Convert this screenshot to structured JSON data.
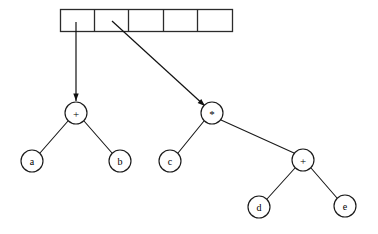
{
  "figure": {
    "background_color": "#ffffff",
    "stroke_color": "#1a1a1a",
    "node_fill": "#ffffff",
    "width": 378,
    "height": 234
  },
  "array": {
    "name": "pointer-array",
    "cell_count": 5,
    "x": 60,
    "y": 9,
    "width": 172,
    "height": 22,
    "cells": [
      {
        "index": 0,
        "label": "",
        "has_pointer": true
      },
      {
        "index": 1,
        "label": "",
        "has_pointer": true
      },
      {
        "index": 2,
        "label": "",
        "has_pointer": false
      },
      {
        "index": 3,
        "label": "",
        "has_pointer": false
      },
      {
        "index": 4,
        "label": "",
        "has_pointer": false
      }
    ],
    "dividers_x": [
      94,
      128,
      163,
      197
    ]
  },
  "pointers": [
    {
      "id": "pointer-0",
      "from_cell": 0,
      "to_node": "node-plus-1",
      "x1": 76,
      "y1": 22,
      "x2": 76,
      "y2": 101,
      "arrow": true
    },
    {
      "id": "pointer-1",
      "from_cell": 1,
      "to_node": "node-times",
      "x1": 112,
      "y1": 21,
      "x2": 205,
      "y2": 106,
      "arrow": true
    }
  ],
  "nodes": [
    {
      "id": "node-plus-1",
      "label": "+",
      "cx": 76,
      "cy": 113,
      "r": 11,
      "kind": "operator"
    },
    {
      "id": "node-a",
      "label": "a",
      "cx": 32,
      "cy": 161,
      "r": 11,
      "kind": "operand"
    },
    {
      "id": "node-b",
      "label": "b",
      "cx": 120,
      "cy": 161,
      "r": 11,
      "kind": "operand"
    },
    {
      "id": "node-times",
      "label": "*",
      "cx": 212,
      "cy": 113,
      "r": 11,
      "kind": "operator"
    },
    {
      "id": "node-c",
      "label": "c",
      "cx": 170,
      "cy": 161,
      "r": 11,
      "kind": "operand"
    },
    {
      "id": "node-plus-2",
      "label": "+",
      "cx": 303,
      "cy": 160,
      "r": 11,
      "kind": "operator"
    },
    {
      "id": "node-d",
      "label": "d",
      "cx": 259,
      "cy": 207,
      "r": 11,
      "kind": "operand"
    },
    {
      "id": "node-e",
      "label": "e",
      "cx": 345,
      "cy": 206,
      "r": 11,
      "kind": "operand"
    }
  ],
  "edges": [
    {
      "id": "edge-plus1-a",
      "from": "node-plus-1",
      "to": "node-a",
      "x1": 68,
      "y1": 121,
      "x2": 40,
      "y2": 153
    },
    {
      "id": "edge-plus1-b",
      "from": "node-plus-1",
      "to": "node-b",
      "x1": 84,
      "y1": 121,
      "x2": 112,
      "y2": 153
    },
    {
      "id": "edge-times-c",
      "from": "node-times",
      "to": "node-c",
      "x1": 204,
      "y1": 121,
      "x2": 178,
      "y2": 153
    },
    {
      "id": "edge-times-p2",
      "from": "node-times",
      "to": "node-plus-2",
      "x1": 221,
      "y1": 120,
      "x2": 294,
      "y2": 153
    },
    {
      "id": "edge-plus2-d",
      "from": "node-plus-2",
      "to": "node-d",
      "x1": 295,
      "y1": 168,
      "x2": 267,
      "y2": 199
    },
    {
      "id": "edge-plus2-e",
      "from": "node-plus-2",
      "to": "node-e",
      "x1": 311,
      "y1": 168,
      "x2": 337,
      "y2": 198
    }
  ]
}
